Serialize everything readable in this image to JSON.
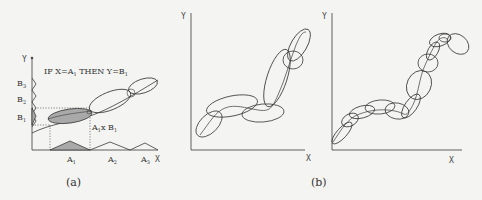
{
  "panel_a": {
    "rule_text": "IF X=A",
    "rule_sub": "1",
    "rule_then": " THEN Y=B",
    "rule_then_sub": "1",
    "y_axis_label": "Y",
    "x_axis_label": "X",
    "y_sets": [
      {
        "label": "B",
        "sub": "3"
      },
      {
        "label": "B",
        "sub": "2"
      },
      {
        "label": "B",
        "sub": "1"
      }
    ],
    "x_sets": [
      {
        "label": "A",
        "sub": "1"
      },
      {
        "label": "A",
        "sub": "2"
      },
      {
        "label": "A",
        "sub": "3"
      }
    ],
    "product_label": "A",
    "product_sub": "1",
    "product_rest": "x B",
    "product_sub2": "1",
    "caption": "(a)"
  },
  "panel_b": {
    "left_plot": {
      "y_axis_label": "Y",
      "x_axis_label": "X",
      "ellipse_count": 6
    },
    "right_plot": {
      "y_axis_label": "Y",
      "x_axis_label": "X",
      "ellipse_count": 12
    },
    "caption": "(b)"
  },
  "colors": {
    "background": "#f4f4f2",
    "stroke": "#3a3a3a",
    "shade": "#a9a9a9"
  }
}
